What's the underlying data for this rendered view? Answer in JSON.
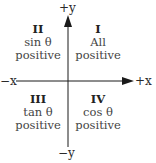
{
  "axes": {
    "pos_y": "+y",
    "neg_y": "−y",
    "pos_x": "+x",
    "neg_x": "−x"
  },
  "quadrants": [
    {
      "numeral": "I",
      "line1": "All",
      "line2": "positive"
    },
    {
      "numeral": "II",
      "line1": "sin θ",
      "line2": "positive"
    },
    {
      "numeral": "III",
      "line1": "tan θ",
      "line2": "positive"
    },
    {
      "numeral": "IV",
      "line1": "cos θ",
      "line2": "positive"
    }
  ],
  "colors": {
    "axis": "#1a1a1a",
    "text": "#444444"
  }
}
